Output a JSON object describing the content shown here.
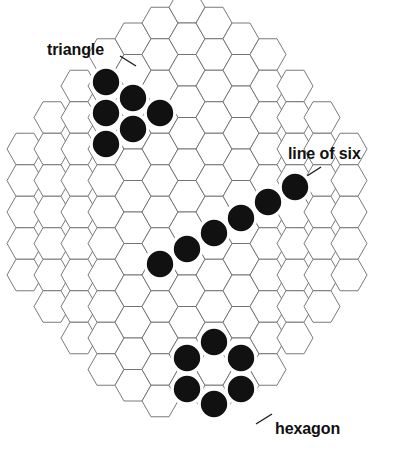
{
  "figure": {
    "name": "hex-board-formations",
    "background_color": "#ffffff",
    "board": {
      "cell_orientation": "flat-top",
      "cell_fill": "#ffffff",
      "cell_stroke": "#6b6b6b",
      "stone_color": "#111111",
      "stone_halo_color": "#ffffff",
      "columns": 13,
      "column_cell_counts": [
        5,
        7,
        9,
        11,
        12,
        13,
        13,
        13,
        12,
        11,
        9,
        7,
        5
      ]
    }
  },
  "annotations": [
    {
      "id": "triangle",
      "label": "triangle"
    },
    {
      "id": "line-of-six",
      "label": "line of six"
    },
    {
      "id": "hexagon",
      "label": "hexagon"
    }
  ],
  "chart_data": {
    "type": "diagram",
    "title": "",
    "subtitle": "",
    "xlabel": "",
    "ylabel": "",
    "grid": true,
    "legend_position": "inline-annotations",
    "geometry": {
      "hex_width": 36,
      "hex_height": 31.5,
      "column_step_x": 27,
      "row_step_y": 31.5,
      "origin_x": 25,
      "origin_y": 23
    },
    "columns": [
      {
        "col": 0,
        "count": 5,
        "top_row": 4
      },
      {
        "col": 1,
        "count": 7,
        "top_row": 3
      },
      {
        "col": 2,
        "count": 9,
        "top_row": 2
      },
      {
        "col": 3,
        "count": 11,
        "top_row": 1
      },
      {
        "col": 4,
        "count": 12,
        "top_row": 0.5
      },
      {
        "col": 5,
        "count": 13,
        "top_row": 0
      },
      {
        "col": 6,
        "count": 13,
        "top_row": -0.5
      },
      {
        "col": 7,
        "count": 13,
        "top_row": 0
      },
      {
        "col": 8,
        "count": 12,
        "top_row": 0.5
      },
      {
        "col": 9,
        "count": 11,
        "top_row": 1
      },
      {
        "col": 10,
        "count": 9,
        "top_row": 2
      },
      {
        "col": 11,
        "count": 7,
        "top_row": 3
      },
      {
        "col": 12,
        "count": 5,
        "top_row": 4
      }
    ],
    "formations": [
      {
        "name": "triangle",
        "label": "triangle",
        "stone_count": 6,
        "stones": [
          {
            "cx": 106,
            "cy": 82
          },
          {
            "cx": 106,
            "cy": 113
          },
          {
            "cx": 106,
            "cy": 144
          },
          {
            "cx": 133,
            "cy": 98
          },
          {
            "cx": 133,
            "cy": 129
          },
          {
            "cx": 160,
            "cy": 113
          }
        ],
        "leader": "M 120 56 L 136 66"
      },
      {
        "name": "line-of-six",
        "label": "line of six",
        "stone_count": 6,
        "stones": [
          {
            "cx": 160,
            "cy": 264
          },
          {
            "cx": 187,
            "cy": 249
          },
          {
            "cx": 214,
            "cy": 233
          },
          {
            "cx": 241,
            "cy": 218
          },
          {
            "cx": 268,
            "cy": 202
          },
          {
            "cx": 295,
            "cy": 187
          }
        ],
        "leader": "M 321 167 L 307 176"
      },
      {
        "name": "hexagon",
        "label": "hexagon",
        "stone_count": 6,
        "stones": [
          {
            "cx": 214,
            "cy": 342
          },
          {
            "cx": 241,
            "cy": 358
          },
          {
            "cx": 241,
            "cy": 389
          },
          {
            "cx": 214,
            "cy": 404
          },
          {
            "cx": 187,
            "cy": 389
          },
          {
            "cx": 187,
            "cy": 358
          }
        ],
        "leader": "M 272 414 L 256 424"
      }
    ]
  }
}
